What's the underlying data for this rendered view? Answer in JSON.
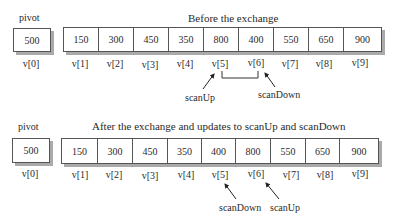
{
  "before": {
    "title": "Before the exchange",
    "pivot_label": "pivot",
    "pivot_value": "500",
    "pivot_index": "v[0]",
    "values": [
      "150",
      "300",
      "450",
      "350",
      "800",
      "400",
      "550",
      "650",
      "900"
    ],
    "indices": [
      "v[1]",
      "v[2]",
      "v[3]",
      "v[4]",
      "v[5]",
      "v[6]",
      "v[7]",
      "v[8]",
      "v[9]"
    ],
    "pointer_left": "scanUp",
    "pointer_right": "scanDown"
  },
  "after": {
    "title": "After the exchange and updates to scanUp and scanDown",
    "pivot_label": "pivot",
    "pivot_value": "500",
    "pivot_index": "v[0]",
    "values": [
      "150",
      "300",
      "450",
      "350",
      "400",
      "800",
      "550",
      "650",
      "900"
    ],
    "indices": [
      "v[1]",
      "v[2]",
      "v[3]",
      "v[4]",
      "v[5]",
      "v[6]",
      "v[7]",
      "v[8]",
      "v[9]"
    ],
    "pointer_left": "scanDown",
    "pointer_right": "scanUp"
  }
}
